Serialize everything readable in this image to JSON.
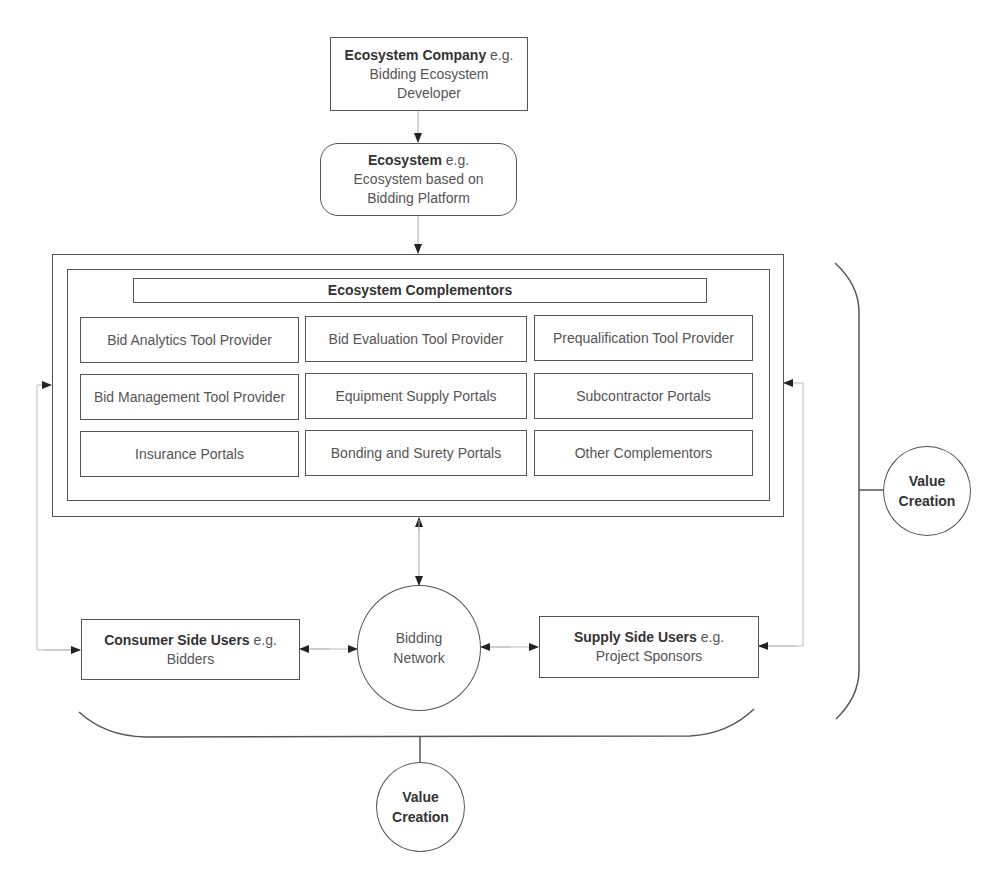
{
  "top": {
    "company": {
      "bold": "Ecosystem Company",
      "rest": " e.g. Bidding Ecosystem Developer"
    },
    "ecosystem": {
      "bold": "Ecosystem",
      "rest": " e.g. Ecosystem based on Bidding Platform"
    }
  },
  "complementors": {
    "header": "Ecosystem Complementors",
    "cells": [
      "Bid Analytics Tool Provider",
      "Bid Evaluation Tool Provider",
      "Prequalification Tool Provider",
      "Bid Management Tool Provider",
      "Equipment Supply Portals",
      "Subcontractor Portals",
      "Insurance Portals",
      "Bonding and Surety Portals",
      "Other Complementors"
    ]
  },
  "users": {
    "consumer": {
      "bold": "Consumer Side Users",
      "rest": " e.g. Bidders"
    },
    "supply": {
      "bold": "Supply Side Users",
      "rest": " e.g. Project Sponsors"
    },
    "network": "Bidding Network"
  },
  "value_creation": {
    "right": "Value Creation",
    "bottom": "Value Creation"
  },
  "colors": {
    "line": "#555555",
    "dotted": "#aaaaaa",
    "text": "#4a4a4a"
  }
}
